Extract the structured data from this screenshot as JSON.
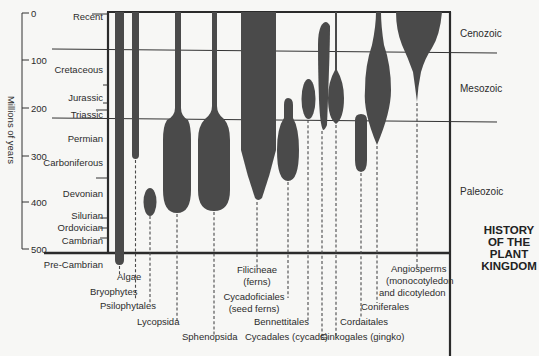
{
  "title": [
    "HISTORY",
    "OF THE",
    "PLANT",
    "KINGDOM"
  ],
  "axis": {
    "label": "Millions of years",
    "ticks": [
      {
        "value": "0",
        "y": 13
      },
      {
        "value": "100",
        "y": 60
      },
      {
        "value": "200",
        "y": 108
      },
      {
        "value": "300",
        "y": 156
      },
      {
        "value": "400",
        "y": 202
      },
      {
        "value": "500",
        "y": 249
      }
    ]
  },
  "periods": [
    {
      "name": "Recent",
      "y": 16
    },
    {
      "name": "Cretaceous",
      "y": 69
    },
    {
      "name": "Jurassic",
      "y": 97
    },
    {
      "name": "Triassic",
      "y": 114
    },
    {
      "name": "Permian",
      "y": 138
    },
    {
      "name": "Carboniferous",
      "y": 162
    },
    {
      "name": "Devonian",
      "y": 193
    },
    {
      "name": "Silurian",
      "y": 215
    },
    {
      "name": "Ordovician",
      "y": 227
    },
    {
      "name": "Cambrian",
      "y": 240
    },
    {
      "name": "Pre-Cambrian",
      "y": 264
    }
  ],
  "eras": [
    {
      "name": "Cenozoic",
      "y": 37
    },
    {
      "name": "Mesozoic",
      "y": 92
    },
    {
      "name": "Paleozoic",
      "y": 195
    }
  ],
  "groups": [
    {
      "name": "Algae",
      "label_lines": [
        "Algae"
      ],
      "x": 117,
      "y": 280
    },
    {
      "name": "Bryophytes",
      "label_lines": [
        "Bryophytes"
      ],
      "x": 90,
      "y": 295
    },
    {
      "name": "Psilophytales",
      "label_lines": [
        "Psilophytales"
      ],
      "x": 100,
      "y": 309
    },
    {
      "name": "Lycopsida",
      "label_lines": [
        "Lycopsida"
      ],
      "x": 137,
      "y": 325
    },
    {
      "name": "Sphenopsida",
      "label_lines": [
        "Sphenopsida"
      ],
      "x": 182,
      "y": 340
    },
    {
      "name": "Filicineae",
      "label_lines": [
        "Filicineae",
        "(ferns)"
      ],
      "x": 231,
      "y": 273
    },
    {
      "name": "Cycadofiliciales",
      "label_lines": [
        "Cycadoficiales",
        "(seed ferns)"
      ],
      "x": 228,
      "y": 300
    },
    {
      "name": "Bennettitales",
      "label_lines": [
        "Bennettitales"
      ],
      "x": 254,
      "y": 325
    },
    {
      "name": "Cycadales",
      "label_lines": [
        "Cycadales (cycads)"
      ],
      "x": 245,
      "y": 340
    },
    {
      "name": "Ginkgoales",
      "label_lines": [
        "Ginkogales (gingko)"
      ],
      "x": 320,
      "y": 340
    },
    {
      "name": "Cordaitales",
      "label_lines": [
        "Cordaitales"
      ],
      "x": 340,
      "y": 325
    },
    {
      "name": "Coniferales",
      "label_lines": [
        "Coniferales"
      ],
      "x": 361,
      "y": 310
    },
    {
      "name": "Angiosperms",
      "label_lines": [
        "Angiosperms",
        "(monocotyledon",
        "and dicotyledon"
      ],
      "x": 386,
      "y": 272
    }
  ]
}
